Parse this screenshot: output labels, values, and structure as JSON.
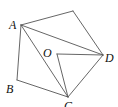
{
  "diagram": {
    "type": "geometry-figure",
    "points": {
      "A": {
        "label": "A",
        "x": 21,
        "y": 25
      },
      "E": {
        "label": "",
        "x": 73,
        "y": 11
      },
      "D": {
        "label": "D",
        "x": 103,
        "y": 55
      },
      "C": {
        "label": "C",
        "x": 68,
        "y": 97
      },
      "B": {
        "label": "B",
        "x": 17,
        "y": 80
      },
      "O": {
        "label": "O",
        "x": 57,
        "y": 54
      }
    },
    "segments": [
      [
        "A",
        "E"
      ],
      [
        "E",
        "D"
      ],
      [
        "A",
        "D"
      ],
      [
        "A",
        "C"
      ],
      [
        "A",
        "B"
      ],
      [
        "B",
        "C"
      ],
      [
        "C",
        "D"
      ],
      [
        "O",
        "D"
      ],
      [
        "O",
        "C"
      ]
    ],
    "line_color": "#555555",
    "label_color": "#111111"
  }
}
